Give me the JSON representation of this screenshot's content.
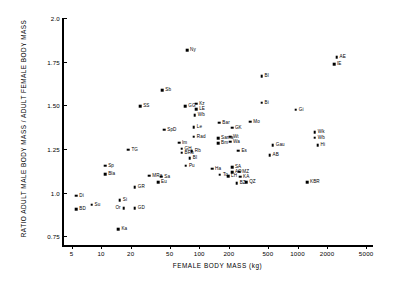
{
  "chart_data": {
    "type": "scatter",
    "title": "",
    "xlabel": "FEMALE BODY MASS (kg)",
    "ylabel": "RATIO ADULT MALE BODY MASS / ADULT FEMALE BODY MASS",
    "xscale": "log",
    "xlim": [
      4,
      5600
    ],
    "ylim": [
      0.7,
      2.0
    ],
    "grid": false,
    "legend": null,
    "xticks": [
      5,
      10,
      20,
      50,
      100,
      200,
      500,
      1000,
      2000,
      5000
    ],
    "xtick_labels": [
      "5",
      "10",
      "20",
      "50",
      "100",
      "200",
      "500",
      "1000",
      "2000",
      "5000"
    ],
    "yticks": [
      0.75,
      1.0,
      1.25,
      1.5,
      1.75,
      2.0
    ],
    "ytick_labels": [
      "0.75",
      "1.0",
      "1.25",
      "1.50",
      "1.75",
      "2.0"
    ],
    "points": [
      {
        "label": "Ny",
        "x": 75,
        "y": 1.815,
        "lx": "right",
        "ly": "mid"
      },
      {
        "label": "AE",
        "x": 2500,
        "y": 1.775,
        "lx": "right",
        "ly": "mid"
      },
      {
        "label": "IE",
        "x": 2350,
        "y": 1.735,
        "lx": "right",
        "ly": "mid"
      },
      {
        "label": "Bl",
        "x": 430,
        "y": 1.665,
        "lx": "right",
        "ly": "mid"
      },
      {
        "label": "Sb",
        "x": 42,
        "y": 1.585,
        "lx": "right",
        "ly": "mid"
      },
      {
        "label": "Bi",
        "x": 430,
        "y": 1.515,
        "lx": "right",
        "ly": "mid"
      },
      {
        "label": "SS",
        "x": 25,
        "y": 1.495,
        "lx": "right",
        "ly": "mid"
      },
      {
        "label": "GG",
        "x": 72,
        "y": 1.495,
        "lx": "right",
        "ly": "mid"
      },
      {
        "label": "Kz",
        "x": 93,
        "y": 1.51,
        "lx": "right",
        "ly": "mid"
      },
      {
        "label": "LE",
        "x": 93,
        "y": 1.478,
        "lx": "right",
        "ly": "mid"
      },
      {
        "label": "Gi",
        "x": 960,
        "y": 1.475,
        "lx": "right",
        "ly": "mid"
      },
      {
        "label": "Wb",
        "x": 90,
        "y": 1.445,
        "lx": "right",
        "ly": "mid"
      },
      {
        "label": "Mo",
        "x": 330,
        "y": 1.405,
        "lx": "right",
        "ly": "mid"
      },
      {
        "label": "Bar",
        "x": 160,
        "y": 1.4,
        "lx": "right",
        "ly": "mid"
      },
      {
        "label": "Le",
        "x": 88,
        "y": 1.375,
        "lx": "right",
        "ly": "mid"
      },
      {
        "label": "GK",
        "x": 215,
        "y": 1.372,
        "lx": "right",
        "ly": "mid"
      },
      {
        "label": "SpD",
        "x": 44,
        "y": 1.36,
        "lx": "right",
        "ly": "mid"
      },
      {
        "label": "Wk",
        "x": 1500,
        "y": 1.345,
        "lx": "right",
        "ly": "mid"
      },
      {
        "label": "Wb2",
        "x": 1500,
        "y": 1.315,
        "lx": "right",
        "ly": "mid"
      },
      {
        "label": "Rad",
        "x": 88,
        "y": 1.32,
        "lx": "right",
        "ly": "mid"
      },
      {
        "label": "Sama",
        "x": 155,
        "y": 1.31,
        "lx": "right",
        "ly": "mid"
      },
      {
        "label": "Wt",
        "x": 205,
        "y": 1.32,
        "lx": "right",
        "ly": "mid"
      },
      {
        "label": "Wa",
        "x": 205,
        "y": 1.292,
        "lx": "right",
        "ly": "mid"
      },
      {
        "label": "Hi",
        "x": 1600,
        "y": 1.27,
        "lx": "right",
        "ly": "mid"
      },
      {
        "label": "Bm",
        "x": 155,
        "y": 1.282,
        "lx": "right",
        "ly": "mid"
      },
      {
        "label": "Im",
        "x": 62,
        "y": 1.285,
        "lx": "right",
        "ly": "mid"
      },
      {
        "label": "Gau",
        "x": 560,
        "y": 1.272,
        "lx": "right",
        "ly": "mid"
      },
      {
        "label": "GH",
        "x": 66,
        "y": 1.252,
        "lx": "right",
        "ly": "mid"
      },
      {
        "label": "BRb",
        "x": 66,
        "y": 1.228,
        "lx": "right",
        "ly": "mid"
      },
      {
        "label": "Rb",
        "x": 84,
        "y": 1.238,
        "lx": "right",
        "ly": "mid"
      },
      {
        "label": "Es",
        "x": 250,
        "y": 1.24,
        "lx": "right",
        "ly": "mid"
      },
      {
        "label": "AB",
        "x": 520,
        "y": 1.215,
        "lx": "right",
        "ly": "mid"
      },
      {
        "label": "TG",
        "x": 19,
        "y": 1.245,
        "lx": "right",
        "ly": "mid"
      },
      {
        "label": "Bl2",
        "x": 80,
        "y": 1.198,
        "lx": "right",
        "ly": "mid"
      },
      {
        "label": "Sp",
        "x": 11,
        "y": 1.155,
        "lx": "right",
        "ly": "mid"
      },
      {
        "label": "Pu",
        "x": 73,
        "y": 1.155,
        "lx": "right",
        "ly": "mid"
      },
      {
        "label": "Ha",
        "x": 135,
        "y": 1.138,
        "lx": "right",
        "ly": "mid"
      },
      {
        "label": "SA",
        "x": 215,
        "y": 1.145,
        "lx": "right",
        "ly": "mid"
      },
      {
        "label": "AO",
        "x": 215,
        "y": 1.118,
        "lx": "right",
        "ly": "mid"
      },
      {
        "label": "MZ",
        "x": 255,
        "y": 1.12,
        "lx": "right",
        "ly": "mid"
      },
      {
        "label": "Bla",
        "x": 11,
        "y": 1.105,
        "lx": "right",
        "ly": "mid"
      },
      {
        "label": "To",
        "x": 162,
        "y": 1.102,
        "lx": "right",
        "ly": "mid"
      },
      {
        "label": "LH",
        "x": 196,
        "y": 1.095,
        "lx": "right",
        "ly": "mid"
      },
      {
        "label": "KA",
        "x": 260,
        "y": 1.092,
        "lx": "right",
        "ly": "mid"
      },
      {
        "label": "MRa",
        "x": 31,
        "y": 1.098,
        "lx": "right",
        "ly": "mid"
      },
      {
        "label": "Sa",
        "x": 41,
        "y": 1.09,
        "lx": "right",
        "ly": "mid"
      },
      {
        "label": "KBR",
        "x": 1250,
        "y": 1.06,
        "lx": "right",
        "ly": "mid"
      },
      {
        "label": "Eu",
        "x": 38,
        "y": 1.058,
        "lx": "right",
        "ly": "mid"
      },
      {
        "label": "BZ",
        "x": 240,
        "y": 1.055,
        "lx": "right",
        "ly": "mid"
      },
      {
        "label": "QZ",
        "x": 300,
        "y": 1.058,
        "lx": "right",
        "ly": "mid"
      },
      {
        "label": "GR",
        "x": 22,
        "y": 1.03,
        "lx": "right",
        "ly": "mid"
      },
      {
        "label": "Di",
        "x": 5.6,
        "y": 0.982,
        "lx": "right",
        "ly": "mid"
      },
      {
        "label": "Si",
        "x": 15.5,
        "y": 0.955,
        "lx": "right",
        "ly": "mid"
      },
      {
        "label": "Su",
        "x": 8.0,
        "y": 0.93,
        "lx": "right",
        "ly": "mid"
      },
      {
        "label": "GD",
        "x": 22,
        "y": 0.912,
        "lx": "right",
        "ly": "mid"
      },
      {
        "label": "Or",
        "x": 17,
        "y": 0.912,
        "lx": "left",
        "ly": "mid"
      },
      {
        "label": "BD",
        "x": 5.6,
        "y": 0.905,
        "lx": "right",
        "ly": "mid"
      },
      {
        "label": "Ka",
        "x": 15,
        "y": 0.79,
        "lx": "right",
        "ly": "mid"
      }
    ]
  }
}
